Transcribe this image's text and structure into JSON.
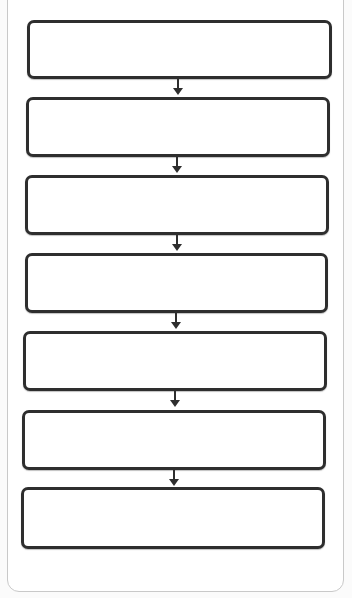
{
  "diagram": {
    "type": "vertical-flowchart",
    "node_count": 7,
    "nodes": [
      {
        "id": 1,
        "label": ""
      },
      {
        "id": 2,
        "label": ""
      },
      {
        "id": 3,
        "label": ""
      },
      {
        "id": 4,
        "label": ""
      },
      {
        "id": 5,
        "label": ""
      },
      {
        "id": 6,
        "label": ""
      },
      {
        "id": 7,
        "label": ""
      }
    ],
    "edges": [
      {
        "from": 1,
        "to": 2
      },
      {
        "from": 2,
        "to": 3
      },
      {
        "from": 3,
        "to": 4
      },
      {
        "from": 4,
        "to": 5
      },
      {
        "from": 5,
        "to": 6
      },
      {
        "from": 6,
        "to": 7
      }
    ],
    "colors": {
      "node_border": "#2e2e2e",
      "node_fill": "#ffffff",
      "arrow": "#2e2e2e",
      "card_border": "#c9c9c9",
      "background": "#fbfbfb"
    }
  }
}
